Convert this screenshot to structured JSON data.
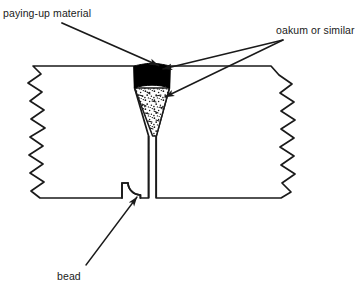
{
  "figure": {
    "name": "caulked-plank-seam-cross-section",
    "background_color": "#ffffff",
    "ink_color": "#1a1a1a"
  },
  "labels": {
    "paying_up": "paying-up material",
    "oakum": "oakum or similar",
    "bead": "bead"
  },
  "callouts": [
    {
      "name": "paying-up-material-callout",
      "text": "paying-up material",
      "from": [
        62,
        23
      ],
      "to": [
        160,
        66
      ],
      "arrowhead": "filled-triangle"
    },
    {
      "name": "oakum-callout-upper",
      "text": "oakum or similar",
      "from": [
        283,
        40
      ],
      "to": [
        161,
        68
      ],
      "arrowhead": "filled-triangle"
    },
    {
      "name": "oakum-callout-lower",
      "text": "oakum or similar",
      "from": [
        283,
        40
      ],
      "to": [
        163,
        97
      ],
      "arrowhead": "filled-triangle"
    },
    {
      "name": "bead-callout",
      "text": "bead",
      "from": [
        88,
        266
      ],
      "to": [
        136,
        198
      ],
      "arrowhead": "filled-triangle"
    }
  ],
  "parts": [
    {
      "name": "left-plank",
      "description": "left timber plank with zigzag break edge on left side",
      "fill": "#ffffff",
      "stroke": "#1a1a1a"
    },
    {
      "name": "right-plank",
      "description": "right timber plank with zigzag break edge on right side",
      "fill": "#ffffff",
      "stroke": "#1a1a1a"
    },
    {
      "name": "seam-gap",
      "description": "vertical seam between the two planks",
      "stroke": "#1a1a1a"
    },
    {
      "name": "paying-up-material-cap",
      "description": "solid black wedge filling the top of the V groove",
      "fill": "#000000"
    },
    {
      "name": "oakum-caulking",
      "description": "stippled tapering wedge of oakum packed below the paying-up material",
      "fill": "#ffffff",
      "pattern": "stipple"
    },
    {
      "name": "bead-notch",
      "description": "rounded quarter-round bead moulding at the bottom edge of the left plank",
      "stroke": "#1a1a1a"
    }
  ],
  "geometry": {
    "top_edge_y": 66,
    "bottom_edge_y": 198,
    "seam_center_x": 152,
    "v_groove_top_half_width": 18,
    "v_groove_apex_y": 136,
    "black_cap_bottom_y": 88,
    "left_plank_left_x": 30,
    "right_plank_right_x": 330
  }
}
